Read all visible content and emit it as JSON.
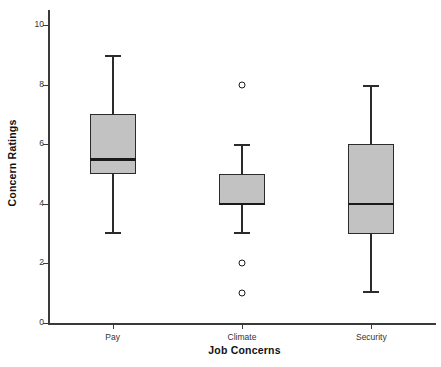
{
  "chart_data": {
    "type": "box",
    "title": "",
    "xlabel": "Job Concerns",
    "ylabel": "Concern Ratings",
    "ylim": [
      0,
      10.5
    ],
    "yticks": [
      0,
      2,
      4,
      6,
      8,
      10
    ],
    "ytick_labels": [
      "0",
      "2",
      "4",
      "6",
      "8",
      "10"
    ],
    "grid": false,
    "legend": null,
    "categories": [
      "Pay",
      "Climate",
      "Security"
    ],
    "boxes": [
      {
        "category": "Pay",
        "whisker_low": 3,
        "q1": 5,
        "median": 5.5,
        "q3": 7,
        "whisker_high": 9,
        "outliers": []
      },
      {
        "category": "Climate",
        "whisker_low": 3,
        "q1": 4,
        "median": 4,
        "q3": 5,
        "whisker_high": 6,
        "outliers": [
          8,
          2,
          1
        ]
      },
      {
        "category": "Security",
        "whisker_low": 1,
        "q1": 3,
        "median": 4,
        "q3": 6,
        "whisker_high": 8,
        "outliers": []
      }
    ],
    "colors": {
      "box_fill": "#c2c2c2",
      "box_edge": "#2b2b2b",
      "median": "#1a1a1a",
      "whisker": "#2b2b2b",
      "axis": "#3a3a3a",
      "background": "#ffffff"
    }
  }
}
